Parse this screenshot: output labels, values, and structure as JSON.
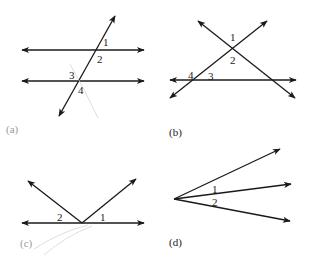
{
  "figure": {
    "panels": [
      {
        "id": "a",
        "caption": "(a)",
        "description": "Two parallel lines cut by a transversal",
        "angle_labels": [
          "1",
          "2",
          "3",
          "4"
        ]
      },
      {
        "id": "b",
        "caption": "(b)",
        "description": "Two intersecting lines crossing a third line",
        "angle_labels": [
          "1",
          "2",
          "4",
          "3"
        ]
      },
      {
        "id": "c",
        "caption": "(c)",
        "description": "Two rays from a point on a line",
        "angle_labels": [
          "2",
          "1"
        ]
      },
      {
        "id": "d",
        "caption": "(d)",
        "description": "Three rays from a common vertex",
        "angle_labels": [
          "1",
          "2"
        ]
      }
    ]
  },
  "colors": {
    "line": "#1a1a1a",
    "background": "#ffffff",
    "faint_caption": "#9a9a9a"
  }
}
